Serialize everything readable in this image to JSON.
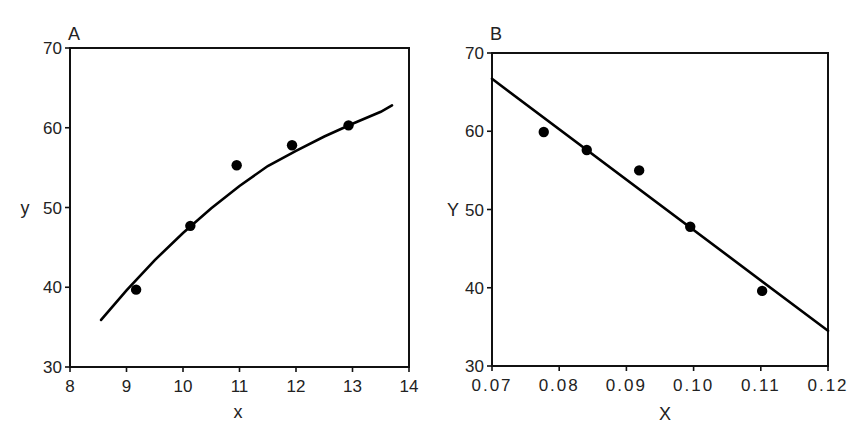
{
  "chart_data": [
    {
      "panel": "A",
      "type": "scatter",
      "xlabel": "x",
      "ylabel": "y",
      "xlim": [
        8,
        14
      ],
      "ylim": [
        30,
        70
      ],
      "xticks": [
        8,
        9,
        10,
        11,
        12,
        13,
        14
      ],
      "yticks": [
        30,
        40,
        50,
        60,
        70
      ],
      "grid": false,
      "series": [
        {
          "name": "observed",
          "type": "scatter",
          "x": [
            9.17,
            10.13,
            10.95,
            11.93,
            12.93
          ],
          "y": [
            39.7,
            47.7,
            55.3,
            57.8,
            60.3
          ]
        },
        {
          "name": "fitted curve",
          "type": "line",
          "x": [
            8.55,
            9.0,
            9.5,
            10.0,
            10.5,
            11.0,
            11.5,
            12.0,
            12.5,
            13.0,
            13.5,
            13.7
          ],
          "y": [
            35.9,
            39.6,
            43.4,
            46.8,
            49.9,
            52.7,
            55.2,
            57.1,
            58.9,
            60.5,
            62.0,
            62.8
          ]
        }
      ]
    },
    {
      "panel": "B",
      "type": "scatter",
      "xlabel": "X",
      "ylabel": "Y",
      "xlim": [
        0.07,
        0.12
      ],
      "ylim": [
        30,
        70
      ],
      "xticks": [
        "0.07",
        "0.08",
        "0.09",
        "0.10",
        "0.11",
        "0.12"
      ],
      "yticks": [
        30,
        40,
        50,
        60,
        70
      ],
      "grid": false,
      "series": [
        {
          "name": "observed",
          "type": "scatter",
          "x": [
            0.0777,
            0.0841,
            0.0919,
            0.0995,
            0.1102
          ],
          "y": [
            59.9,
            57.6,
            55.0,
            47.8,
            39.6
          ]
        },
        {
          "name": "fitted line",
          "type": "line",
          "x": [
            0.07,
            0.12
          ],
          "y": [
            66.7,
            34.5
          ]
        }
      ]
    }
  ],
  "panels": {
    "a": {
      "label": "A",
      "xlabel": "x",
      "ylabel": "y",
      "xticks": [
        "8",
        "9",
        "10",
        "11",
        "12",
        "13",
        "14"
      ],
      "yticks": [
        "30",
        "40",
        "50",
        "60",
        "70"
      ]
    },
    "b": {
      "label": "B",
      "xlabel": "X",
      "ylabel": "Y",
      "xticks": [
        "0.07",
        "0.08",
        "0.09",
        "0.10",
        "0.11",
        "0.12"
      ],
      "yticks": [
        "30",
        "40",
        "50",
        "60",
        "70"
      ]
    }
  }
}
